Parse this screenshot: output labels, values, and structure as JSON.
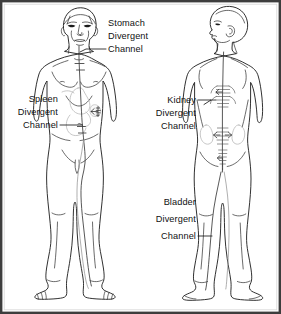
{
  "figure": {
    "view_left": "anterior figure",
    "view_right": "posterior figure",
    "border_color": "#3d3d3d",
    "background_color": "#ffffff",
    "line_color": "#1a1a1a",
    "organ_line_color": "#b4b4b4",
    "channel_color": "#3a3a3a",
    "text_color": "#111111"
  },
  "labels": [
    {
      "id": "stomach",
      "name": "stomach-divergent-channel-label",
      "lines": [
        "Stomach",
        "Divergent",
        "Channel"
      ],
      "align": "start",
      "anchor_target": "neck-throat"
    },
    {
      "id": "spleen",
      "name": "spleen-divergent-channel-label",
      "lines": [
        "Spleen",
        "Divergent",
        "Channel"
      ],
      "align": "end",
      "anchor_target": "hip-abdomen"
    },
    {
      "id": "kidney",
      "name": "kidney-divergent-channel-label",
      "lines": [
        "Kidney",
        "Divergent",
        "Channel"
      ],
      "align": "end",
      "anchor_target": "mid-back-spine"
    },
    {
      "id": "bladder",
      "name": "bladder-divergent-channel-label",
      "lines": [
        "Bladder",
        "Divergent",
        "Channel"
      ],
      "align": "end",
      "anchor_target": "posterior-leg"
    }
  ]
}
